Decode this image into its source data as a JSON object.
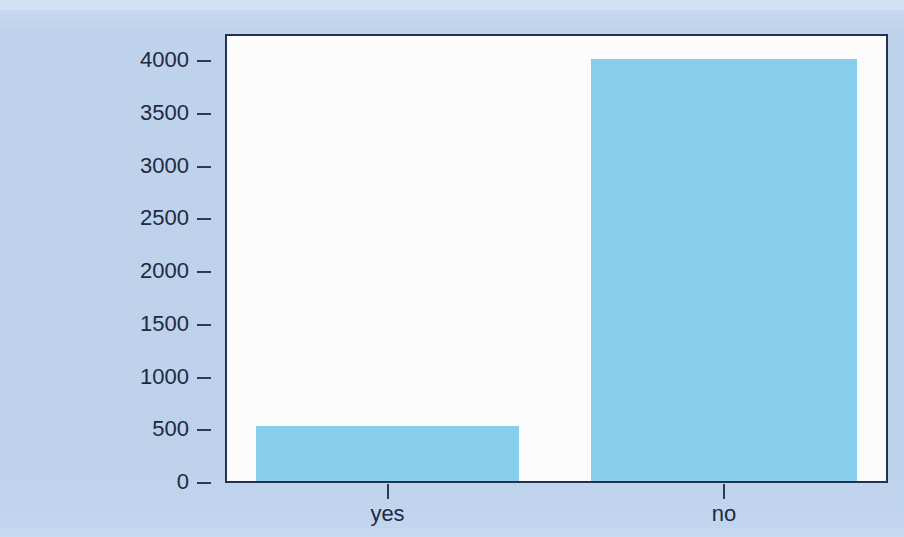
{
  "chart_data": {
    "type": "bar",
    "title": "",
    "subtitle": "",
    "xlabel": "",
    "ylabel": "",
    "categories": [
      "yes",
      "no"
    ],
    "values": [
      520,
      4000
    ],
    "series": [
      {
        "name": "count",
        "values": [
          520,
          4000
        ]
      }
    ],
    "ylim": [
      0,
      4000
    ],
    "yticks": [
      0,
      500,
      1000,
      1500,
      2000,
      2500,
      3000,
      3500,
      4000
    ],
    "ytick_labels": [
      "0",
      "500",
      "1000",
      "1500",
      "2000",
      "2500",
      "3000",
      "3500",
      "4000"
    ],
    "xtick_labels": [
      "yes",
      "no"
    ],
    "grid": false,
    "legend": false,
    "legend_position": "none",
    "bar_color": "#83d0ef",
    "axis_color": "#1b2c4c",
    "plot_background": "#ffffff",
    "page_background": "#bed3ef",
    "text_color": "#16233d"
  }
}
